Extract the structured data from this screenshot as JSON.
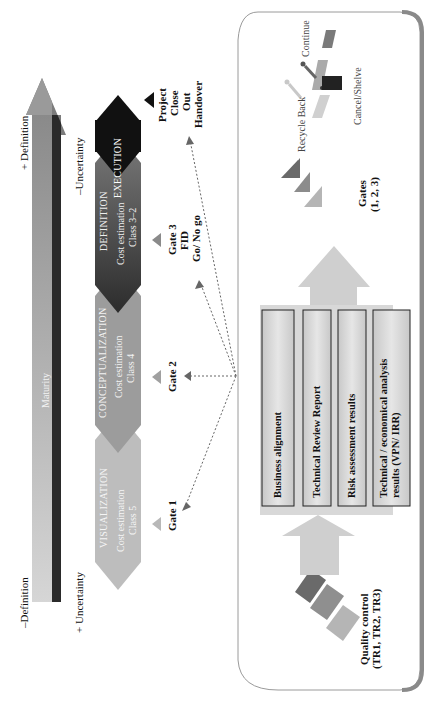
{
  "maturity_axis": {
    "label": "Maturity",
    "top_label": "+ Definition",
    "bottom_label": "–Definition",
    "uncertainty_top": "–Uncertainty",
    "uncertainty_bottom": "+ Uncertainty"
  },
  "phases": [
    {
      "title": "VISUALIZATION",
      "line1": "Cost estimation",
      "line2": "Class 5",
      "color": "#b9b9b9"
    },
    {
      "title": "CONCEPTUALIZATION",
      "line1": "Cost estimation",
      "line2": "Class 4",
      "color": "#9a9a9a"
    },
    {
      "title": "DEFINITION",
      "line1": "Cost estimation",
      "line2": "Class 3–2",
      "color": "#6a6a6a"
    },
    {
      "title": "EXECUTION",
      "line1": "",
      "line2": "",
      "color": "#111111"
    }
  ],
  "gates": [
    {
      "label": "Gate 1"
    },
    {
      "label": "Gate 2"
    },
    {
      "label": "Gate 3",
      "line2": "FID",
      "line3": "Go/ No go"
    },
    {
      "label": "Project",
      "line2": "Close",
      "line3": "Out",
      "line4": "Handover"
    }
  ],
  "panel": {
    "quality_control": {
      "line1": "Quality control",
      "line2": "(TR1, TR2, TR3)"
    },
    "deliverables": [
      {
        "label": "Business alignment"
      },
      {
        "label": "Technical Review Report"
      },
      {
        "label": "Risk assessment results"
      },
      {
        "label_line1": "Technical / economical analysis",
        "label_line2": "results (VPN/ IRR)"
      }
    ],
    "gates_summary": {
      "line1": "Gates",
      "line2": "(1, 2, 3)"
    },
    "decisions": {
      "recycle": "Recycle Back",
      "continue": "Continue",
      "cancel": "Cancel/Shelve"
    }
  }
}
